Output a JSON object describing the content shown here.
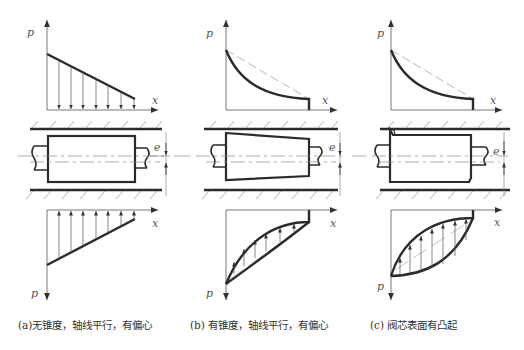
{
  "axis_labels": {
    "pressure": "p",
    "position": "x",
    "eccentricity": "e"
  },
  "panels": [
    {
      "id": "a",
      "caption": "(a)无锥度，轴线平行，有偏心",
      "spool_shape": "cylindrical",
      "top_distribution": "linear",
      "bottom_distribution": "linear"
    },
    {
      "id": "b",
      "caption": "(b) 有锥度，轴线平行，有偏心",
      "spool_shape": "tapered",
      "top_distribution": "concave-curve",
      "bottom_distribution": "convex-curve"
    },
    {
      "id": "c",
      "caption": "(c) 阀芯表面有凸起",
      "spool_shape": "cylindrical-with-burr",
      "top_distribution": "concave-curve",
      "bottom_distribution": "lens"
    }
  ],
  "colors": {
    "line": "#2b2b2b",
    "thin": "#555555",
    "dash": "#8a8a8a",
    "caption": "#333333"
  }
}
